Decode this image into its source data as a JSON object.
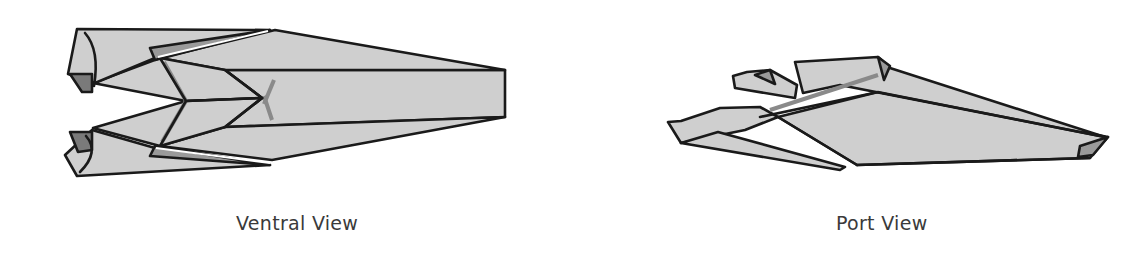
{
  "figure": {
    "views": [
      {
        "id": "ventral",
        "caption": "Ventral View"
      },
      {
        "id": "port",
        "caption": "Port View"
      }
    ],
    "colors": {
      "background": "#ffffff",
      "hull_light": "#cfcfcf",
      "hull_mid": "#9a9a9a",
      "hull_dark": "#7a7a7a",
      "outline": "#1a1a1a",
      "caption_text": "#3a3a3a"
    }
  }
}
